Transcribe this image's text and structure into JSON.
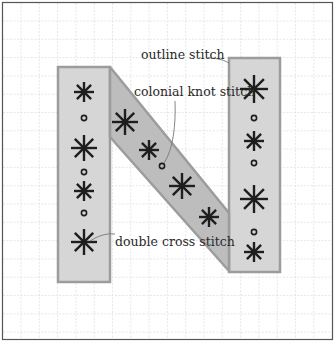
{
  "figure": {
    "colors": {
      "background": "#ffffff",
      "grid": "#dcdcdc",
      "frame": "#555555",
      "column_fill": "#d6d6d6",
      "diagonal_fill": "#bdbdbd",
      "shape_outline": "#9c9c9c",
      "stitch": "#1e1e1e",
      "leader": "#777777"
    },
    "labels": {
      "outline": "outline stitch",
      "colonial_knot": "colonial knot stitch",
      "double_cross": "double cross stitch"
    },
    "left_column": {
      "stitches": [
        {
          "type": "double-cross",
          "x": 84,
          "y": 92,
          "r": 10
        },
        {
          "type": "knot",
          "x": 84,
          "y": 118
        },
        {
          "type": "double-cross",
          "x": 84,
          "y": 148,
          "r": 13
        },
        {
          "type": "knot",
          "x": 84,
          "y": 172
        },
        {
          "type": "double-cross",
          "x": 84,
          "y": 191,
          "r": 10
        },
        {
          "type": "knot",
          "x": 84,
          "y": 213
        },
        {
          "type": "double-cross",
          "x": 84,
          "y": 242,
          "r": 13
        }
      ]
    },
    "diagonal": {
      "stitches": [
        {
          "type": "double-cross",
          "x": 125,
          "y": 122,
          "r": 13
        },
        {
          "type": "double-cross",
          "x": 149,
          "y": 150,
          "r": 10
        },
        {
          "type": "knot",
          "x": 162,
          "y": 166
        },
        {
          "type": "double-cross",
          "x": 182,
          "y": 186,
          "r": 13
        },
        {
          "type": "double-cross",
          "x": 209,
          "y": 217,
          "r": 10
        }
      ]
    },
    "right_column": {
      "stitches": [
        {
          "type": "double-cross",
          "x": 254,
          "y": 89,
          "r": 14
        },
        {
          "type": "knot",
          "x": 254,
          "y": 118
        },
        {
          "type": "double-cross",
          "x": 254,
          "y": 141,
          "r": 10
        },
        {
          "type": "knot",
          "x": 254,
          "y": 163
        },
        {
          "type": "double-cross",
          "x": 254,
          "y": 199,
          "r": 14
        },
        {
          "type": "knot",
          "x": 254,
          "y": 232
        },
        {
          "type": "double-cross",
          "x": 254,
          "y": 252,
          "r": 10
        }
      ]
    }
  }
}
